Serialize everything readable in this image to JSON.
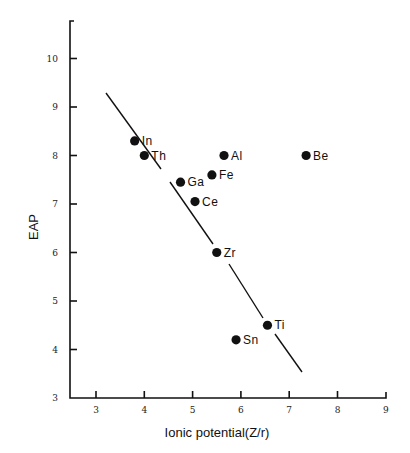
{
  "chart_data": {
    "type": "scatter",
    "title": "",
    "xlabel": "Ionic potential(Z/r)",
    "ylabel": "EAP",
    "xlim": [
      2.5,
      9
    ],
    "ylim": [
      3,
      10.8
    ],
    "xticks": [
      3,
      4,
      5,
      6,
      7,
      8,
      9
    ],
    "yticks": [
      3,
      4,
      5,
      6,
      7,
      8,
      9,
      10
    ],
    "grid": false,
    "legend": null,
    "points": [
      {
        "label": "In",
        "x": 3.8,
        "y": 8.3
      },
      {
        "label": "Th",
        "x": 4.0,
        "y": 8.0
      },
      {
        "label": "Ga",
        "x": 4.75,
        "y": 7.45
      },
      {
        "label": "Ce",
        "x": 5.05,
        "y": 7.05
      },
      {
        "label": "Fe",
        "x": 5.4,
        "y": 7.6
      },
      {
        "label": "Al",
        "x": 5.65,
        "y": 8.0
      },
      {
        "label": "Be",
        "x": 7.35,
        "y": 8.0
      },
      {
        "label": "Zr",
        "x": 5.5,
        "y": 6.0
      },
      {
        "label": "Ti",
        "x": 6.55,
        "y": 4.5
      },
      {
        "label": "Sn",
        "x": 5.9,
        "y": 4.2
      }
    ],
    "trend_line": {
      "style": "broken solid line",
      "from": {
        "x": 3.2,
        "y": 9.3
      },
      "to": {
        "x": 7.25,
        "y": 3.55
      }
    }
  }
}
